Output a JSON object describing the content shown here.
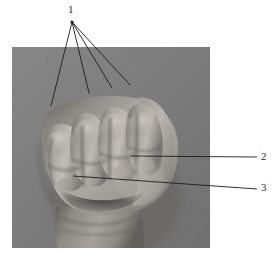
{
  "figure": {
    "type": "anatomical-photograph",
    "view": "dorsal-fist-front-view",
    "color_mode": "grayscale",
    "background_color": "#ffffff",
    "photo": {
      "background_color": "#7b7b7b",
      "frame": {
        "x": 12,
        "y": 47,
        "width": 198,
        "height": 201
      }
    },
    "callouts": [
      {
        "id": "callout-1",
        "label": "1",
        "label_position": {
          "x": 72,
          "y": 10
        },
        "anchor": {
          "x": 72,
          "y": 22
        },
        "leader_count": 4,
        "targets": [
          {
            "x": 51,
            "y": 106
          },
          {
            "x": 89,
            "y": 93
          },
          {
            "x": 112,
            "y": 88
          },
          {
            "x": 130,
            "y": 85
          }
        ]
      },
      {
        "id": "callout-2",
        "label": "2",
        "label_position": {
          "x": 264,
          "y": 157
        },
        "leader_start": {
          "x": 131,
          "y": 156
        },
        "leader_end": {
          "x": 257,
          "y": 157
        }
      },
      {
        "id": "callout-3",
        "label": "3",
        "label_position": {
          "x": 264,
          "y": 188
        },
        "leader_start": {
          "x": 73,
          "y": 176
        },
        "leader_end": {
          "x": 257,
          "y": 189
        }
      }
    ],
    "line_color": "#1d1d1d",
    "label_color": "#2c2c2c"
  }
}
